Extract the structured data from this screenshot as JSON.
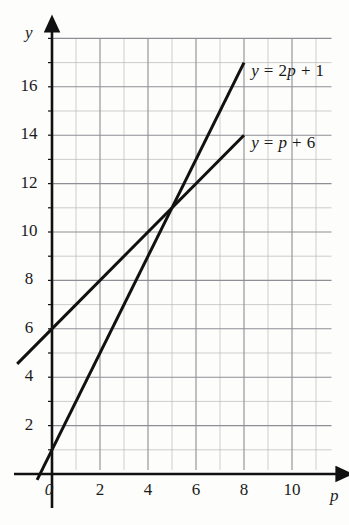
{
  "chart_data": {
    "type": "line",
    "title": "",
    "xlabel": "p",
    "ylabel": "y",
    "xlim": [
      -1.8,
      11.6
    ],
    "ylim": [
      -0.9,
      18.0
    ],
    "grid": true,
    "grid_minor_step": 1,
    "grid_major_step": 2,
    "legend_position": "inline-right",
    "xticks": [
      0,
      2,
      4,
      6,
      8,
      10
    ],
    "xtick_labels": [
      "0",
      "2",
      "4",
      "6",
      "8",
      "10"
    ],
    "yticks": [
      2,
      4,
      6,
      8,
      10,
      12,
      14,
      16
    ],
    "ytick_labels": [
      "2",
      "4",
      "6",
      "8",
      "10",
      "12",
      "14",
      "16"
    ],
    "series": [
      {
        "name": "y = 2p + 1",
        "equation": "y = 2p + 1",
        "slope": 2,
        "intercept": 1,
        "x_start": -0.62,
        "x_end": 8.0,
        "y_start": -0.24,
        "y_end": 17.0,
        "label_x": 8.3,
        "label_y": 16.7
      },
      {
        "name": "y = p + 6",
        "equation": "y = p + 6",
        "slope": 1,
        "intercept": 6,
        "x_start": -1.45,
        "x_end": 8.0,
        "y_start": 4.55,
        "y_end": 14.0,
        "label_x": 8.3,
        "label_y": 13.7
      }
    ],
    "intersection": {
      "x": 5,
      "y": 11
    },
    "annotations": []
  },
  "labels": {
    "y_axis_name": "y",
    "x_axis_name": "p",
    "series_1_lhs": "y",
    "series_1_eq": "= 2",
    "series_1_var": "p",
    "series_1_tail": "+ 1",
    "series_2_lhs": "y",
    "series_2_eq": "=",
    "series_2_var": "p",
    "series_2_tail": "+ 6"
  },
  "colors": {
    "background": "#fdfdfc",
    "axis": "#111111",
    "line": "#111111",
    "grid_minor": "#b9b9bd",
    "grid_major": "#8e8e94",
    "text": "#1a1a1a"
  }
}
